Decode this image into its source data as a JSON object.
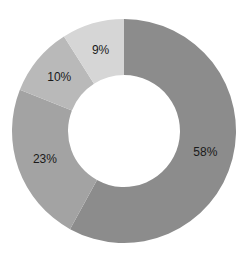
{
  "chart_data": {
    "type": "pie",
    "subtype": "donut",
    "title": "",
    "categories": [
      "Slice A",
      "Slice B",
      "Slice C",
      "Slice D"
    ],
    "values": [
      58,
      23,
      10,
      9
    ],
    "labels": [
      "58%",
      "23%",
      "10%",
      "9%"
    ],
    "colors": [
      "#8c8c8c",
      "#a3a3a3",
      "#b9b9b9",
      "#d6d6d6"
    ],
    "start_angle_deg": 0,
    "direction": "clockwise",
    "legend": "none",
    "geometry": {
      "cx": 124,
      "cy": 131,
      "outer_r": 112,
      "inner_r": 56
    }
  }
}
